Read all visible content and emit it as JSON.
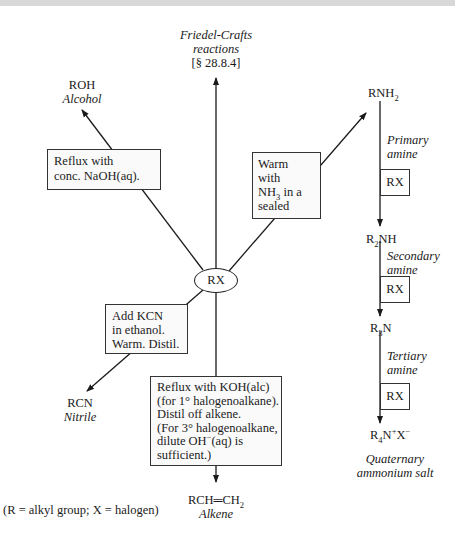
{
  "center": {
    "label": "RX"
  },
  "friedel_crafts": {
    "line1": "Friedel-Crafts",
    "line2": "reactions",
    "ref": "[§ 28.8.4]"
  },
  "alcohol": {
    "formula": "ROH",
    "name": "Alcohol",
    "condition": [
      "Reflux with",
      "conc. NaOH(aq)."
    ]
  },
  "amine_route": {
    "condition": [
      "Warm",
      "with",
      "NH3 in a",
      "sealed"
    ],
    "steps": [
      {
        "product_main": "RNH",
        "product_sub": "2",
        "name": [
          "Primary",
          "amine"
        ],
        "reagent": "RX"
      },
      {
        "product_pre": "R",
        "product_pre_sub": "2",
        "product_main": "NH",
        "name": [
          "Secondary",
          "amine"
        ],
        "reagent": "RX"
      },
      {
        "product_pre": "R",
        "product_pre_sub": "3",
        "product_main": "N",
        "name": [
          "Tertiary",
          "amine"
        ],
        "reagent": "RX"
      }
    ],
    "final_product": "R4N+X−",
    "final_name": [
      "Quaternary",
      "ammonium salt"
    ]
  },
  "nitrile": {
    "formula": "RCN",
    "name": "Nitrile",
    "condition": [
      "Add KCN",
      "in ethanol.",
      "Warm. Distil."
    ]
  },
  "alkene": {
    "formula": "RCH═CH2",
    "name": "Alkene",
    "condition": [
      "Reflux with KOH(alc)",
      "(for 1° halogenoalkane).",
      "Distil off alkene.",
      "(For 3° halogenoalkane,",
      "dilute OH−(aq) is",
      "sufficient.)"
    ]
  },
  "legend": "(R = alkyl group; X = halogen)"
}
